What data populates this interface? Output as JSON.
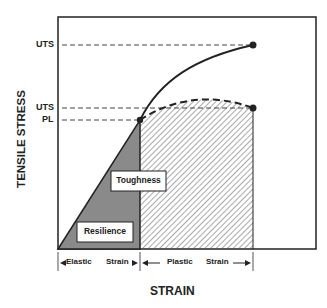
{
  "diagram": {
    "x_axis_label": "STRAIN",
    "y_axis_label": "TENSILE STRESS",
    "y_markers": [
      {
        "label": "UTS",
        "note": "upper curve ultimate tensile strength"
      },
      {
        "label": "UTS",
        "note": "lower curve ultimate tensile strength"
      },
      {
        "label": "PL",
        "note": "proportional limit"
      }
    ],
    "regions": {
      "toughness_label": "Toughness",
      "resilience_label": "Resilience"
    },
    "strain_ranges": {
      "elastic_left": "Elastic",
      "elastic_right": "Strain",
      "plastic_left": "Plastic",
      "plastic_right": "Strain"
    },
    "colors": {
      "line": "#222222",
      "resilience_fill": "#8a8a8a",
      "hatch": "#555555",
      "background": "#ffffff"
    }
  }
}
